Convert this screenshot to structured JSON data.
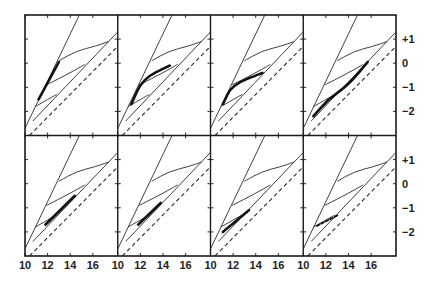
{
  "figure": {
    "frame": {
      "x": 25,
      "y": 15,
      "panel_w": 92.75,
      "panel_h": 120.5,
      "cols": 4,
      "rows": 2
    },
    "ink_color": "#2a2a2a",
    "x_tick_labels": [
      "10",
      "12",
      "14",
      "16"
    ],
    "y_tick_labels": [
      "+1",
      "0",
      "−1",
      "−2"
    ]
  },
  "chart_data": {
    "type": "line",
    "title": "",
    "xlabel": "",
    "ylabel": "",
    "layout": "2 rows x 4 columns of small-multiple panels sharing axes",
    "x_ticks": [
      10,
      12,
      14,
      16
    ],
    "xlim": [
      10,
      18.2
    ],
    "y_ticks": [
      1,
      0,
      -1,
      -2
    ],
    "ylim": [
      -3.0,
      2.0
    ],
    "grid": false,
    "legend": null,
    "background_series": [
      {
        "name": "steep solid line",
        "style": "solid thin",
        "x": [
          10.0,
          14.8
        ],
        "y": [
          -2.7,
          2.0
        ]
      },
      {
        "name": "right solid line",
        "style": "solid thin",
        "x": [
          10.7,
          18.2
        ],
        "y": [
          -2.4,
          1.3
        ]
      },
      {
        "name": "dashed reference line",
        "style": "dashed",
        "x": [
          10.4,
          18.2
        ],
        "y": [
          -3.0,
          0.7
        ]
      },
      {
        "name": "upper S-curve",
        "style": "solid thin",
        "x": [
          13.0,
          14.5,
          16.2,
          17.4
        ],
        "y": [
          0.1,
          0.5,
          0.7,
          0.9
        ]
      },
      {
        "name": "middle curve",
        "style": "solid thin",
        "x": [
          11.9,
          14.0,
          15.3
        ],
        "y": [
          -0.9,
          -0.4,
          -0.05
        ]
      },
      {
        "name": "lower curve",
        "style": "solid thin",
        "x": [
          10.9,
          12.4,
          12.8
        ],
        "y": [
          -1.8,
          -1.4,
          -1.3
        ]
      }
    ],
    "highlight_series": [
      {
        "panel": 1,
        "row": 1,
        "col": 1,
        "x": [
          11.2,
          13.0
        ],
        "y": [
          -1.5,
          0.05
        ]
      },
      {
        "panel": 2,
        "row": 1,
        "col": 2,
        "x": [
          11.2,
          12.2,
          14.6
        ],
        "y": [
          -1.7,
          -0.65,
          -0.1
        ]
      },
      {
        "panel": 3,
        "row": 1,
        "col": 3,
        "x": [
          11.1,
          11.9,
          14.6
        ],
        "y": [
          -1.7,
          -0.9,
          -0.4
        ]
      },
      {
        "panel": 4,
        "row": 1,
        "col": 4,
        "x": [
          10.9,
          12.2,
          14.0,
          15.7
        ],
        "y": [
          -2.2,
          -1.5,
          -0.9,
          0.05
        ]
      },
      {
        "panel": 5,
        "row": 2,
        "col": 1,
        "x": [
          11.8,
          14.4
        ],
        "y": [
          -1.7,
          -0.5
        ]
      },
      {
        "panel": 6,
        "row": 2,
        "col": 2,
        "x": [
          11.8,
          13.8
        ],
        "y": [
          -1.7,
          -0.8
        ]
      },
      {
        "panel": 7,
        "row": 2,
        "col": 3,
        "x": [
          11.1,
          13.4
        ],
        "y": [
          -2.0,
          -1.1
        ],
        "style": "hatched bold"
      },
      {
        "panel": 8,
        "row": 2,
        "col": 4,
        "x": [
          11.2,
          13.1
        ],
        "y": [
          -1.75,
          -1.3
        ],
        "style": "dashed bold"
      }
    ]
  }
}
